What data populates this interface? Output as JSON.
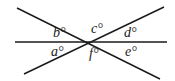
{
  "diagram": {
    "colors": {
      "line": "#1a1a1a",
      "background": "#ffffff"
    },
    "lines": [
      {
        "name": "horizontal-line",
        "x1": 15,
        "y1": 42,
        "x2": 167,
        "y2": 42
      },
      {
        "name": "descending-line",
        "x1": 17,
        "y1": 8,
        "x2": 160,
        "y2": 79
      },
      {
        "name": "ascending-line",
        "x1": 24,
        "y1": 74,
        "x2": 164,
        "y2": 7
      }
    ],
    "angles": [
      {
        "id": "a",
        "label": "a°",
        "x": 51,
        "y": 56
      },
      {
        "id": "b",
        "label": "b°",
        "x": 53,
        "y": 37
      },
      {
        "id": "c",
        "label": "c°",
        "x": 91,
        "y": 33
      },
      {
        "id": "d",
        "label": "d°",
        "x": 124,
        "y": 37
      },
      {
        "id": "e",
        "label": "e°",
        "x": 125,
        "y": 56
      },
      {
        "id": "f",
        "label": "f°",
        "x": 89,
        "y": 58
      }
    ]
  }
}
